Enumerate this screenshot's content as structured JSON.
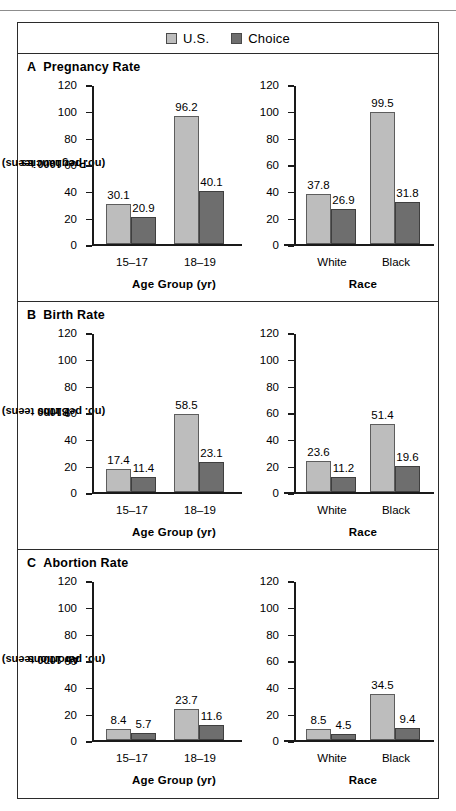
{
  "legend": {
    "items": [
      {
        "label": "U.S.",
        "color": "#bdbdbd",
        "icon": "legend-swatch-icon"
      },
      {
        "label": "Choice",
        "color": "#6e6e6e",
        "icon": "legend-swatch-icon"
      }
    ]
  },
  "axis": {
    "ticks": [
      "120",
      "100",
      "80",
      "60",
      "40",
      "20",
      "0"
    ]
  },
  "panels": [
    {
      "letter": "A",
      "title": "Pregnancy Rate",
      "ylabel_line1": "Pregnancies",
      "ylabel_line2": "(no. per 1000 teens)",
      "left": {
        "xtitle": "Age Group (yr)",
        "categories": [
          "15–17",
          "18–19"
        ],
        "us": [
          30.1,
          96.2
        ],
        "choice": [
          20.9,
          40.1
        ],
        "us_labels": [
          "30.1",
          "96.2"
        ],
        "choice_labels": [
          "20.9",
          "40.1"
        ]
      },
      "right": {
        "xtitle": "Race",
        "categories": [
          "White",
          "Black"
        ],
        "us": [
          37.8,
          99.5
        ],
        "choice": [
          26.9,
          31.8
        ],
        "us_labels": [
          "37.8",
          "99.5"
        ],
        "choice_labels": [
          "26.9",
          "31.8"
        ]
      }
    },
    {
      "letter": "B",
      "title": "Birth Rate",
      "ylabel_line1": "Births",
      "ylabel_line2": "(no. per 1000 teens)",
      "left": {
        "xtitle": "Age Group (yr)",
        "categories": [
          "15–17",
          "18–19"
        ],
        "us": [
          17.4,
          58.5
        ],
        "choice": [
          11.4,
          23.1
        ],
        "us_labels": [
          "17.4",
          "58.5"
        ],
        "choice_labels": [
          "11.4",
          "23.1"
        ]
      },
      "right": {
        "xtitle": "Race",
        "categories": [
          "White",
          "Black"
        ],
        "us": [
          23.6,
          51.4
        ],
        "choice": [
          11.2,
          19.6
        ],
        "us_labels": [
          "23.6",
          "51.4"
        ],
        "choice_labels": [
          "11.2",
          "19.6"
        ]
      }
    },
    {
      "letter": "C",
      "title": "Abortion Rate",
      "ylabel_line1": "Abortions",
      "ylabel_line2": "(no. per 1000 teens)",
      "left": {
        "xtitle": "Age Group (yr)",
        "categories": [
          "15–17",
          "18–19"
        ],
        "us": [
          8.4,
          23.7
        ],
        "choice": [
          5.7,
          11.6
        ],
        "us_labels": [
          "8.4",
          "23.7"
        ],
        "choice_labels": [
          "5.7",
          "11.6"
        ]
      },
      "right": {
        "xtitle": "Race",
        "categories": [
          "White",
          "Black"
        ],
        "us": [
          8.5,
          34.5
        ],
        "choice": [
          4.5,
          9.4
        ],
        "us_labels": [
          "8.5",
          "34.5"
        ],
        "choice_labels": [
          "4.5",
          "9.4"
        ]
      }
    }
  ],
  "chart_data": [
    {
      "type": "bar",
      "title": "A  Pregnancy Rate",
      "subtitle": "Age Group (yr)",
      "xlabel": "Age Group (yr)",
      "ylabel": "Pregnancies (no. per 1000 teens)",
      "ylim": [
        0,
        120
      ],
      "yticks": [
        0,
        20,
        40,
        60,
        80,
        100,
        120
      ],
      "grid": false,
      "legend": "top",
      "categories": [
        "15-17",
        "18-19"
      ],
      "series": [
        {
          "name": "U.S.",
          "values": [
            30.1,
            96.2
          ]
        },
        {
          "name": "Choice",
          "values": [
            20.9,
            40.1
          ]
        }
      ]
    },
    {
      "type": "bar",
      "title": "A  Pregnancy Rate",
      "subtitle": "Race",
      "xlabel": "Race",
      "ylabel": "Pregnancies (no. per 1000 teens)",
      "ylim": [
        0,
        120
      ],
      "yticks": [
        0,
        20,
        40,
        60,
        80,
        100,
        120
      ],
      "grid": false,
      "legend": "top",
      "categories": [
        "White",
        "Black"
      ],
      "series": [
        {
          "name": "U.S.",
          "values": [
            37.8,
            99.5
          ]
        },
        {
          "name": "Choice",
          "values": [
            26.9,
            31.8
          ]
        }
      ]
    },
    {
      "type": "bar",
      "title": "B  Birth Rate",
      "subtitle": "Age Group (yr)",
      "xlabel": "Age Group (yr)",
      "ylabel": "Births (no. per 1000 teens)",
      "ylim": [
        0,
        120
      ],
      "yticks": [
        0,
        20,
        40,
        60,
        80,
        100,
        120
      ],
      "grid": false,
      "legend": "top",
      "categories": [
        "15-17",
        "18-19"
      ],
      "series": [
        {
          "name": "U.S.",
          "values": [
            17.4,
            58.5
          ]
        },
        {
          "name": "Choice",
          "values": [
            11.4,
            23.1
          ]
        }
      ]
    },
    {
      "type": "bar",
      "title": "B  Birth Rate",
      "subtitle": "Race",
      "xlabel": "Race",
      "ylabel": "Births (no. per 1000 teens)",
      "ylim": [
        0,
        120
      ],
      "yticks": [
        0,
        20,
        40,
        60,
        80,
        100,
        120
      ],
      "grid": false,
      "legend": "top",
      "categories": [
        "White",
        "Black"
      ],
      "series": [
        {
          "name": "U.S.",
          "values": [
            23.6,
            51.4
          ]
        },
        {
          "name": "Choice",
          "values": [
            11.2,
            19.6
          ]
        }
      ]
    },
    {
      "type": "bar",
      "title": "C  Abortion Rate",
      "subtitle": "Age Group (yr)",
      "xlabel": "Age Group (yr)",
      "ylabel": "Abortions (no. per 1000 teens)",
      "ylim": [
        0,
        120
      ],
      "yticks": [
        0,
        20,
        40,
        60,
        80,
        100,
        120
      ],
      "grid": false,
      "legend": "top",
      "categories": [
        "15-17",
        "18-19"
      ],
      "series": [
        {
          "name": "U.S.",
          "values": [
            8.4,
            23.7
          ]
        },
        {
          "name": "Choice",
          "values": [
            5.7,
            11.6
          ]
        }
      ]
    },
    {
      "type": "bar",
      "title": "C  Abortion Rate",
      "subtitle": "Race",
      "xlabel": "Race",
      "ylabel": "Abortions (no. per 1000 teens)",
      "ylim": [
        0,
        120
      ],
      "yticks": [
        0,
        20,
        40,
        60,
        80,
        100,
        120
      ],
      "grid": false,
      "legend": "top",
      "categories": [
        "White",
        "Black"
      ],
      "series": [
        {
          "name": "U.S.",
          "values": [
            8.5,
            34.5
          ]
        },
        {
          "name": "Choice",
          "values": [
            4.5,
            9.4
          ]
        }
      ]
    }
  ]
}
